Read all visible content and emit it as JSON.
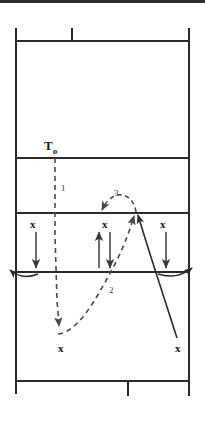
{
  "diagram": {
    "background_color": "#ffffff",
    "line_color": "#2b2b2b",
    "dash_color": "#4a4a4a",
    "labels": {
      "server": "T",
      "server_sub": "o",
      "path_1": "1",
      "path_2": "2",
      "path_3": "3"
    },
    "front_row_players": [
      {
        "mark": "x",
        "x": 33,
        "y": 224
      },
      {
        "mark": "x",
        "x": 105,
        "y": 224
      },
      {
        "mark": "x",
        "x": 163,
        "y": 224
      }
    ],
    "back_row_players": [
      {
        "mark": "x",
        "x": 61,
        "y": 348
      },
      {
        "mark": "x",
        "x": 178,
        "y": 348
      }
    ],
    "court_lines": {
      "left": 16,
      "right": 189,
      "top": 41,
      "bottom": 381,
      "far_attack_line_y": 158,
      "near_attack_line_y": 213,
      "net_line_y": 272
    },
    "ticks": [
      {
        "name": "top-service-tick",
        "x": 72,
        "y1": 28,
        "y2": 41
      },
      {
        "name": "bottom-service-tick",
        "x": 128,
        "y1": 381,
        "y2": 396
      }
    ]
  }
}
